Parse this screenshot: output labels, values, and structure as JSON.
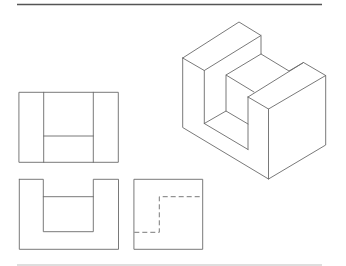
{
  "figure": {
    "title": "",
    "type": "orthographic-and-isometric-projection",
    "colors": {
      "line": "#6a6a6a",
      "rule_top": "#555555",
      "rule_bottom": "#bdbdbd",
      "background": "#ffffff"
    },
    "views": [
      {
        "name": "isometric-view",
        "label": ""
      },
      {
        "name": "top-view",
        "label": ""
      },
      {
        "name": "front-view",
        "label": ""
      },
      {
        "name": "side-view",
        "label": ""
      }
    ]
  }
}
